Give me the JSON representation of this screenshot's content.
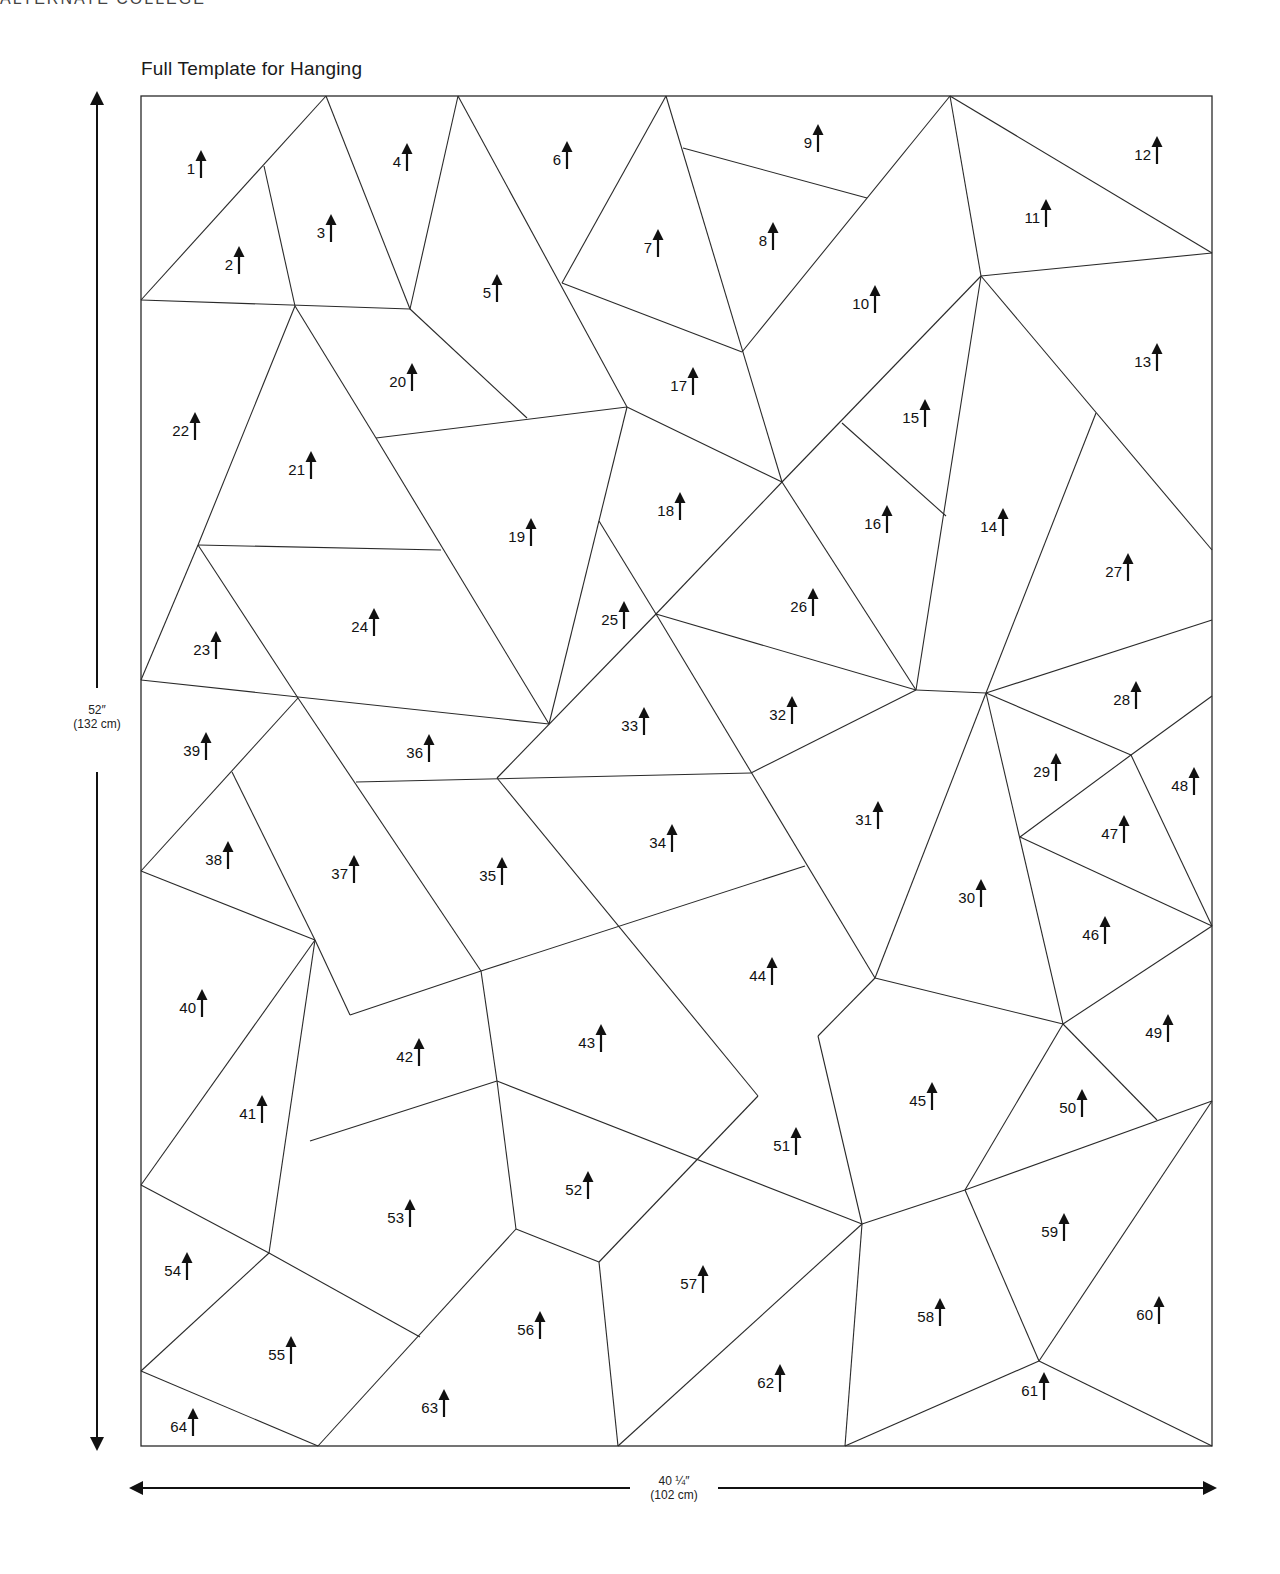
{
  "title": "Full Template for Hanging",
  "header_cut": "ALTERNATE COLLEGE",
  "dimensions": {
    "height": {
      "primary": "52″",
      "secondary": "(132 cm)"
    },
    "width": {
      "primary": "40 ¼″",
      "secondary": "(102 cm)"
    }
  },
  "frame": {
    "x1": 141,
    "y1": 96,
    "x2": 1212,
    "y2": 1446
  },
  "edges": [
    [
      141,
      300,
      326,
      96
    ],
    [
      264,
      166,
      295,
      306
    ],
    [
      326,
      96,
      410,
      309
    ],
    [
      141,
      300,
      410,
      309
    ],
    [
      410,
      309,
      458,
      96
    ],
    [
      458,
      96,
      627,
      407
    ],
    [
      410,
      309,
      527,
      418
    ],
    [
      295,
      306,
      376,
      438
    ],
    [
      376,
      438,
      627,
      407
    ],
    [
      666,
      96,
      562,
      283
    ],
    [
      562,
      283,
      742,
      352
    ],
    [
      683,
      148,
      867,
      198
    ],
    [
      666,
      96,
      782,
      482
    ],
    [
      742,
      352,
      950,
      96
    ],
    [
      950,
      96,
      981,
      276
    ],
    [
      950,
      96,
      1212,
      253
    ],
    [
      981,
      276,
      1212,
      253
    ],
    [
      981,
      276,
      782,
      482
    ],
    [
      842,
      423,
      946,
      516
    ],
    [
      981,
      276,
      916,
      690
    ],
    [
      981,
      276,
      1212,
      550
    ],
    [
      1096,
      413,
      986,
      693
    ],
    [
      295,
      306,
      198,
      545
    ],
    [
      198,
      545,
      441,
      550
    ],
    [
      376,
      438,
      549,
      724
    ],
    [
      627,
      407,
      549,
      724
    ],
    [
      599,
      521,
      656,
      614
    ],
    [
      627,
      407,
      782,
      482
    ],
    [
      782,
      482,
      656,
      614
    ],
    [
      782,
      482,
      916,
      690
    ],
    [
      656,
      614,
      916,
      690
    ],
    [
      198,
      545,
      141,
      680
    ],
    [
      198,
      545,
      298,
      698
    ],
    [
      141,
      680,
      549,
      724
    ],
    [
      298,
      698,
      481,
      971
    ],
    [
      656,
      614,
      497,
      778
    ],
    [
      656,
      614,
      875,
      978
    ],
    [
      356,
      782,
      751,
      773
    ],
    [
      751,
      773,
      916,
      690
    ],
    [
      916,
      690,
      986,
      693
    ],
    [
      986,
      693,
      1212,
      620
    ],
    [
      986,
      693,
      1131,
      755
    ],
    [
      1131,
      755,
      1212,
      696
    ],
    [
      1131,
      755,
      1020,
      837
    ],
    [
      1131,
      755,
      1212,
      926
    ],
    [
      986,
      693,
      875,
      978
    ],
    [
      986,
      693,
      1063,
      1024
    ],
    [
      1020,
      837,
      1212,
      926
    ],
    [
      1063,
      1024,
      1212,
      926
    ],
    [
      1063,
      1024,
      875,
      978
    ],
    [
      298,
      698,
      141,
      871
    ],
    [
      232,
      772,
      315,
      940
    ],
    [
      141,
      871,
      315,
      940
    ],
    [
      315,
      940,
      350,
      1015
    ],
    [
      350,
      1015,
      481,
      971
    ],
    [
      481,
      971,
      805,
      866
    ],
    [
      497,
      778,
      758,
      1096
    ],
    [
      875,
      978,
      818,
      1036
    ],
    [
      818,
      1036,
      862,
      1224
    ],
    [
      1063,
      1024,
      1157,
      1120
    ],
    [
      1063,
      1024,
      965,
      1190
    ],
    [
      965,
      1190,
      1212,
      1101
    ],
    [
      481,
      971,
      497,
      1081
    ],
    [
      315,
      940,
      141,
      1185
    ],
    [
      315,
      940,
      269,
      1253
    ],
    [
      310,
      1141,
      497,
      1081
    ],
    [
      497,
      1081,
      516,
      1229
    ],
    [
      497,
      1081,
      862,
      1224
    ],
    [
      758,
      1096,
      599,
      1262
    ],
    [
      516,
      1229,
      599,
      1262
    ],
    [
      516,
      1229,
      318,
      1446
    ],
    [
      599,
      1262,
      618,
      1446
    ],
    [
      862,
      1224,
      618,
      1446
    ],
    [
      862,
      1224,
      845,
      1446
    ],
    [
      862,
      1224,
      965,
      1190
    ],
    [
      965,
      1190,
      1039,
      1361
    ],
    [
      1212,
      1101,
      1039,
      1361
    ],
    [
      1039,
      1361,
      845,
      1446
    ],
    [
      1039,
      1361,
      1212,
      1446
    ],
    [
      141,
      1185,
      269,
      1253
    ],
    [
      269,
      1253,
      141,
      1371
    ],
    [
      269,
      1253,
      420,
      1337
    ],
    [
      141,
      1371,
      318,
      1446
    ]
  ],
  "pieces": [
    {
      "n": "1",
      "x": 198,
      "y": 164
    },
    {
      "n": "2",
      "x": 236,
      "y": 260
    },
    {
      "n": "3",
      "x": 328,
      "y": 228
    },
    {
      "n": "4",
      "x": 404,
      "y": 157
    },
    {
      "n": "5",
      "x": 494,
      "y": 288
    },
    {
      "n": "6",
      "x": 564,
      "y": 155
    },
    {
      "n": "7",
      "x": 655,
      "y": 243
    },
    {
      "n": "8",
      "x": 770,
      "y": 236
    },
    {
      "n": "9",
      "x": 815,
      "y": 138
    },
    {
      "n": "10",
      "x": 872,
      "y": 299
    },
    {
      "n": "11",
      "x": 1043,
      "y": 213
    },
    {
      "n": "12",
      "x": 1154,
      "y": 150
    },
    {
      "n": "13",
      "x": 1154,
      "y": 357
    },
    {
      "n": "14",
      "x": 1000,
      "y": 522
    },
    {
      "n": "15",
      "x": 922,
      "y": 413
    },
    {
      "n": "16",
      "x": 884,
      "y": 519
    },
    {
      "n": "17",
      "x": 690,
      "y": 381
    },
    {
      "n": "18",
      "x": 677,
      "y": 506
    },
    {
      "n": "19",
      "x": 528,
      "y": 532
    },
    {
      "n": "20",
      "x": 409,
      "y": 377
    },
    {
      "n": "21",
      "x": 308,
      "y": 465
    },
    {
      "n": "22",
      "x": 192,
      "y": 426
    },
    {
      "n": "23",
      "x": 213,
      "y": 645
    },
    {
      "n": "24",
      "x": 371,
      "y": 622
    },
    {
      "n": "25",
      "x": 621,
      "y": 615
    },
    {
      "n": "26",
      "x": 810,
      "y": 602
    },
    {
      "n": "27",
      "x": 1125,
      "y": 567
    },
    {
      "n": "28",
      "x": 1133,
      "y": 695
    },
    {
      "n": "29",
      "x": 1053,
      "y": 767
    },
    {
      "n": "30",
      "x": 978,
      "y": 893
    },
    {
      "n": "31",
      "x": 875,
      "y": 815
    },
    {
      "n": "32",
      "x": 789,
      "y": 710
    },
    {
      "n": "33",
      "x": 641,
      "y": 721
    },
    {
      "n": "34",
      "x": 669,
      "y": 838
    },
    {
      "n": "35",
      "x": 499,
      "y": 871
    },
    {
      "n": "36",
      "x": 426,
      "y": 748
    },
    {
      "n": "37",
      "x": 351,
      "y": 869
    },
    {
      "n": "38",
      "x": 225,
      "y": 855
    },
    {
      "n": "39",
      "x": 203,
      "y": 746
    },
    {
      "n": "40",
      "x": 199,
      "y": 1003
    },
    {
      "n": "41",
      "x": 259,
      "y": 1109
    },
    {
      "n": "42",
      "x": 416,
      "y": 1052
    },
    {
      "n": "43",
      "x": 598,
      "y": 1038
    },
    {
      "n": "44",
      "x": 769,
      "y": 971
    },
    {
      "n": "45",
      "x": 929,
      "y": 1096
    },
    {
      "n": "46",
      "x": 1102,
      "y": 930
    },
    {
      "n": "47",
      "x": 1121,
      "y": 829
    },
    {
      "n": "48",
      "x": 1191,
      "y": 781
    },
    {
      "n": "49",
      "x": 1165,
      "y": 1028
    },
    {
      "n": "50",
      "x": 1079,
      "y": 1103
    },
    {
      "n": "51",
      "x": 793,
      "y": 1141
    },
    {
      "n": "52",
      "x": 585,
      "y": 1185
    },
    {
      "n": "53",
      "x": 407,
      "y": 1213
    },
    {
      "n": "54",
      "x": 184,
      "y": 1266
    },
    {
      "n": "55",
      "x": 288,
      "y": 1350
    },
    {
      "n": "56",
      "x": 537,
      "y": 1325
    },
    {
      "n": "57",
      "x": 700,
      "y": 1279
    },
    {
      "n": "58",
      "x": 937,
      "y": 1312
    },
    {
      "n": "59",
      "x": 1061,
      "y": 1227
    },
    {
      "n": "60",
      "x": 1156,
      "y": 1310
    },
    {
      "n": "61",
      "x": 1041,
      "y": 1386
    },
    {
      "n": "62",
      "x": 777,
      "y": 1378
    },
    {
      "n": "63",
      "x": 441,
      "y": 1403
    },
    {
      "n": "64",
      "x": 190,
      "y": 1422
    }
  ],
  "style": {
    "line_color": "#2a2a2a",
    "text_color": "#111111",
    "background": "#ffffff"
  }
}
